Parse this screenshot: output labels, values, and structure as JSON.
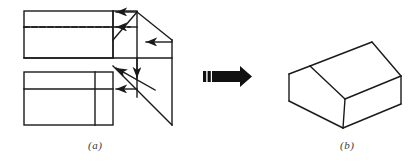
{
  "figure": {
    "background_color": "#ffffff",
    "stroke_color": "#1a1a1a",
    "arrow_color": "#111111",
    "caption_color": "#3a3a3a",
    "width": 416,
    "height": 165,
    "panels": [
      {
        "id": "a",
        "label": "(a)",
        "label_x": 88,
        "label_y": 139,
        "description": "Unfolded net / plan view with fold lines, a dashed crease and direction arrows indicating the folding motion",
        "stroke_width": 1.4,
        "elements": {
          "top_rectangle": {
            "x": 24,
            "y": 11,
            "width": 89,
            "height": 47
          },
          "top_inner_divider_y": 27,
          "dashed_crease": {
            "x1": 24,
            "y1": 27,
            "x2": 125,
            "y2": 27,
            "dash": "5 3"
          },
          "top_right_vertical_x": 113,
          "bottom_rectangle": {
            "x": 24,
            "y": 72,
            "width": 89,
            "height": 53
          },
          "bottom_inner_divider_y": 89,
          "bottom_right_vertical_x": 95,
          "apex": {
            "x": 137,
            "y": 12
          },
          "right_edge_x": 172,
          "right_edge_top_y": 40,
          "right_edge_bottom_y": 125,
          "mid_horizontal_y": 58,
          "center_vertical_x": 137,
          "left_fold_vertical_x": 113
        },
        "arrows": [
          {
            "name": "top-fold-arrow",
            "from": [
              137,
              12
            ],
            "to": [
              113,
              12
            ],
            "direction": "left"
          },
          {
            "name": "crease-fold-arrow",
            "from": [
              137,
              27
            ],
            "to": [
              113,
              27
            ],
            "direction": "left"
          },
          {
            "name": "side-fold-arrow",
            "from": [
              172,
              42
            ],
            "to": [
              143,
              42
            ],
            "direction": "left"
          },
          {
            "name": "down-fold-arrow",
            "from": [
              137,
              58
            ],
            "to": [
              137,
              80
            ],
            "direction": "down"
          },
          {
            "name": "diagonal-fold-arrow",
            "from": [
              155,
              90
            ],
            "to": [
              113,
              66
            ],
            "direction": "up-left"
          },
          {
            "name": "lower-fold-arrow",
            "from": [
              137,
              89
            ],
            "to": [
              113,
              89
            ],
            "direction": "left"
          }
        ]
      },
      {
        "id": "b",
        "label": "(b)",
        "label_x": 340,
        "label_y": 139,
        "description": "Resulting three-dimensional gable-roofed prism shown in oblique projection",
        "stroke_width": 1.4,
        "elements": {
          "ridge_line": {
            "x1": 310,
            "y1": 66,
            "x2": 372,
            "y2": 42
          },
          "roof_near_slope": {
            "x1": 310,
            "y1": 66,
            "x2": 345,
            "y2": 99
          },
          "roof_far_slope": {
            "x1": 372,
            "y1": 42,
            "x2": 401,
            "y2": 76
          },
          "front_gable_left": {
            "x1": 310,
            "y1": 66,
            "x2": 289,
            "y2": 74
          },
          "wall_left_vertical": {
            "x1": 289,
            "y1": 74,
            "x2": 289,
            "y2": 101
          },
          "wall_bottom_left": {
            "x1": 289,
            "y1": 101,
            "x2": 343,
            "y2": 128
          },
          "wall_bottom_right": {
            "x1": 343,
            "y1": 128,
            "x2": 401,
            "y2": 104
          },
          "wall_right_vertical": {
            "x1": 401,
            "y1": 76,
            "x2": 401,
            "y2": 104
          },
          "eave_line": {
            "x1": 343,
            "y1": 128,
            "x2": 345,
            "y2": 99
          },
          "eave_to_right": {
            "x1": 345,
            "y1": 99,
            "x2": 401,
            "y2": 76
          }
        }
      }
    ],
    "transition_arrow": {
      "name": "transform-arrow",
      "shape": "block-arrow-right",
      "x": 203,
      "y": 68,
      "width": 47,
      "height": 17,
      "color": "#111111",
      "tail_stripes": 2
    }
  }
}
